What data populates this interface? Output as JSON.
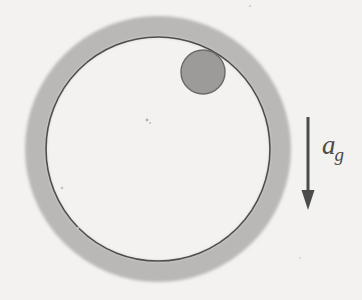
{
  "figure": {
    "background_color": "#f3f2f0",
    "paper_grain": true
  },
  "hoop": {
    "name": "circular-hoop",
    "center_x": 158,
    "center_y": 149,
    "inner_radius": 112,
    "outer_radius": 133,
    "band_color": "#b9b8b6",
    "outline_color": "#4e4e4e",
    "outline_width": 1.6
  },
  "ball": {
    "name": "ball",
    "center_x": 203,
    "center_y": 72,
    "radius": 22,
    "fill_color": "#9c9b99",
    "stroke_color": "#6a6a68",
    "stroke_width": 1.4
  },
  "arrow": {
    "name": "gravity-arrow",
    "x": 308,
    "y_start": 117,
    "y_end": 210,
    "color": "#4b4b4b",
    "shaft_width": 3,
    "head_width": 13,
    "head_length": 20,
    "direction": "down"
  },
  "labels": {
    "gravity": {
      "base": "a",
      "subscript": "g",
      "full": "a_g",
      "x": 322,
      "y": 132,
      "color": "#4b4b4b"
    }
  },
  "specks": [
    {
      "x": 147,
      "y": 120,
      "r": 1.4,
      "color": "#b0afad"
    },
    {
      "x": 150,
      "y": 123,
      "r": 1.0,
      "color": "#bdbcba"
    },
    {
      "x": 62,
      "y": 188,
      "r": 1.3,
      "color": "#c2c1bf"
    },
    {
      "x": 250,
      "y": 6,
      "r": 1.1,
      "color": "#cbcac8"
    },
    {
      "x": 78,
      "y": 228,
      "r": 1.0,
      "color": "#cdccca"
    },
    {
      "x": 300,
      "y": 258,
      "r": 1.0,
      "color": "#d2d1cf"
    }
  ]
}
